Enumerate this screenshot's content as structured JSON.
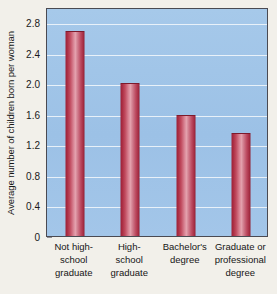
{
  "chart_data": {
    "type": "bar",
    "title": "",
    "xlabel": "",
    "ylabel": "Average number of children born per woman",
    "categories": [
      "Not high-school graduate",
      "High-school graduate",
      "Bachelor's degree",
      "Graduate or professional degree"
    ],
    "category_lines": [
      [
        "Not high-",
        "school",
        "graduate"
      ],
      [
        "High-",
        "school",
        "graduate"
      ],
      [
        "Bachelor's",
        "degree"
      ],
      [
        "Graduate or",
        "professional",
        "degree"
      ]
    ],
    "values": [
      2.68,
      2.0,
      1.58,
      1.35
    ],
    "ylim": [
      0,
      3.0
    ],
    "yticks": [
      "0",
      "0.4",
      "0.8",
      "1.2",
      "1.6",
      "2.0",
      "2.4",
      "2.8"
    ],
    "ytick_values": [
      0,
      0.4,
      0.8,
      1.2,
      1.6,
      2.0,
      2.4,
      2.8
    ],
    "grid": true,
    "legend": "none",
    "colors": {
      "plot_background": "#9fc4e8",
      "gridline": "#eef4fa",
      "bar_dark": "#9d2338",
      "bar_light": "#e4a2ae",
      "page_background": "#f2f0ea",
      "axis_border": "#4a4a52",
      "text": "#161616"
    }
  }
}
